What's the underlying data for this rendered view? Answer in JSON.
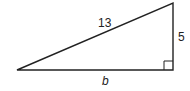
{
  "diagram": {
    "type": "right-triangle",
    "labels": {
      "hypotenuse": "13",
      "vertical_leg": "5",
      "base": "b"
    },
    "right_angle_marker": true,
    "stroke_color": "#222222"
  }
}
